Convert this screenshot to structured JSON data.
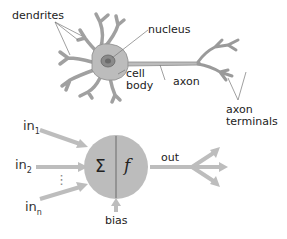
{
  "biological_neuron": {
    "labels": {
      "dendrites": "dendrites",
      "nucleus": "nucleus",
      "cell_body_line1": "cell",
      "cell_body_line2": "body",
      "axon": "axon",
      "axon_terminals_line1": "axon",
      "axon_terminals_line2": "terminals"
    }
  },
  "artificial_neuron": {
    "inputs": [
      {
        "base": "in",
        "sub": "1"
      },
      {
        "base": "in",
        "sub": "2"
      },
      {
        "base": "in",
        "sub": "n"
      }
    ],
    "ellipsis": "⋮",
    "sum_symbol": "Σ",
    "activation_symbol": "f",
    "output_label": "out",
    "bias_label": "bias"
  },
  "colors": {
    "neuron_fill": "#b8b8b8",
    "neuron_stroke": "#8c8c8c",
    "arrow": "#bdbdbd",
    "node_fill": "#bcbcbc",
    "text": "#222222"
  }
}
